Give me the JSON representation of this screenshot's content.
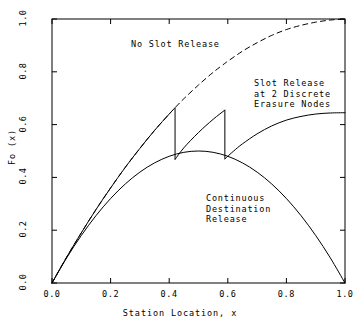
{
  "chart_data": {
    "type": "line",
    "title": "",
    "xlabel": "Station Location, x",
    "ylabel": "Fo (x)",
    "xlim": [
      0.0,
      1.0
    ],
    "ylim": [
      0.0,
      1.0
    ],
    "xticks": [
      "0.0",
      "0.2",
      "0.4",
      "0.6",
      "0.8",
      "1.0"
    ],
    "xtick_values": [
      0.0,
      0.2,
      0.4,
      0.6,
      0.8,
      1.0
    ],
    "yticks": [
      "0.0",
      "0.2",
      "0.4",
      "0.6",
      "0.8",
      "1.0"
    ],
    "ytick_values": [
      0.0,
      0.2,
      0.4,
      0.6,
      0.8,
      1.0
    ],
    "grid": false,
    "legend_position": "inline-annotations",
    "annotations": [
      {
        "name": "no-slot-release",
        "text": "No Slot Release",
        "x": 0.27,
        "y": 0.86
      },
      {
        "name": "slot-release-2-nodes",
        "text": "Slot Release\nat 2 Discrete\nErasure Nodes",
        "x": 0.69,
        "y": 0.72
      },
      {
        "name": "continuous-destination-release",
        "text": "Continuous\nDestination\nRelease",
        "x": 0.53,
        "y": 0.33
      }
    ],
    "series": [
      {
        "name": "No Slot Release",
        "style": "dashed",
        "points": [
          [
            0.0,
            0.0
          ],
          [
            0.05,
            0.098
          ],
          [
            0.1,
            0.19
          ],
          [
            0.15,
            0.278
          ],
          [
            0.2,
            0.36
          ],
          [
            0.25,
            0.438
          ],
          [
            0.3,
            0.51
          ],
          [
            0.35,
            0.578
          ],
          [
            0.4,
            0.64
          ],
          [
            0.42,
            0.664
          ],
          [
            0.45,
            0.698
          ],
          [
            0.5,
            0.75
          ],
          [
            0.55,
            0.798
          ],
          [
            0.59,
            0.832
          ],
          [
            0.6,
            0.84
          ],
          [
            0.65,
            0.878
          ],
          [
            0.7,
            0.91
          ],
          [
            0.75,
            0.938
          ],
          [
            0.8,
            0.96
          ],
          [
            0.85,
            0.976
          ],
          [
            0.9,
            0.988
          ],
          [
            0.95,
            0.996
          ],
          [
            1.0,
            1.0
          ]
        ]
      },
      {
        "name": "Slot Release at 2 Discrete Erasure Nodes",
        "style": "solid",
        "discontinuities": [
          0.42,
          0.59
        ],
        "points": [
          [
            0.0,
            0.0
          ],
          [
            0.05,
            0.098
          ],
          [
            0.1,
            0.19
          ],
          [
            0.15,
            0.278
          ],
          [
            0.2,
            0.36
          ],
          [
            0.25,
            0.438
          ],
          [
            0.3,
            0.51
          ],
          [
            0.35,
            0.578
          ],
          [
            0.4,
            0.64
          ],
          [
            0.42,
            0.664
          ],
          [
            0.42,
            0.468
          ],
          [
            0.45,
            0.512
          ],
          [
            0.5,
            0.57
          ],
          [
            0.55,
            0.62
          ],
          [
            0.59,
            0.655
          ],
          [
            0.59,
            0.47
          ],
          [
            0.62,
            0.5
          ],
          [
            0.65,
            0.527
          ],
          [
            0.7,
            0.565
          ],
          [
            0.75,
            0.595
          ],
          [
            0.8,
            0.617
          ],
          [
            0.85,
            0.631
          ],
          [
            0.9,
            0.64
          ],
          [
            0.95,
            0.644
          ],
          [
            1.0,
            0.645
          ]
        ]
      },
      {
        "name": "Continuous Destination Release",
        "style": "solid",
        "points": [
          [
            0.0,
            0.0
          ],
          [
            0.05,
            0.095
          ],
          [
            0.1,
            0.18
          ],
          [
            0.15,
            0.255
          ],
          [
            0.2,
            0.32
          ],
          [
            0.25,
            0.375
          ],
          [
            0.3,
            0.42
          ],
          [
            0.35,
            0.455
          ],
          [
            0.4,
            0.48
          ],
          [
            0.45,
            0.495
          ],
          [
            0.5,
            0.5
          ],
          [
            0.55,
            0.495
          ],
          [
            0.6,
            0.48
          ],
          [
            0.65,
            0.455
          ],
          [
            0.7,
            0.42
          ],
          [
            0.75,
            0.375
          ],
          [
            0.8,
            0.32
          ],
          [
            0.85,
            0.255
          ],
          [
            0.9,
            0.18
          ],
          [
            0.95,
            0.095
          ],
          [
            1.0,
            0.0
          ]
        ]
      }
    ]
  },
  "axes": {
    "frame": {
      "left_px": 52,
      "right_px": 345,
      "top_px": 19,
      "bottom_px": 283
    }
  }
}
